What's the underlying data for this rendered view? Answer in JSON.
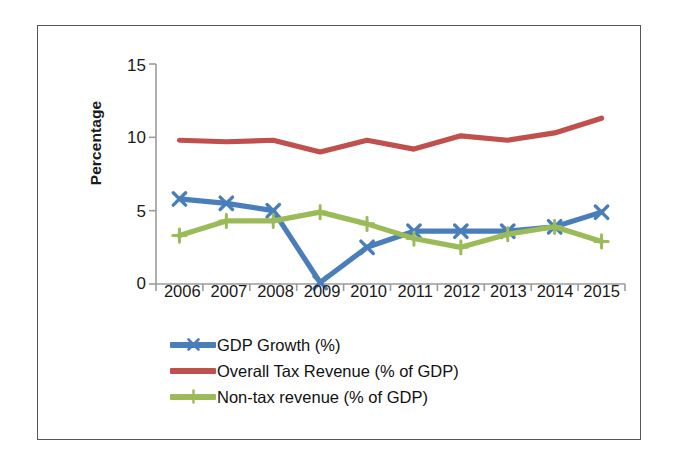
{
  "chart_data": {
    "type": "line",
    "title": "",
    "xlabel": "",
    "ylabel": "Percentage",
    "categories": [
      "2006",
      "2007",
      "2008",
      "2009",
      "2010",
      "2011",
      "2012",
      "2013",
      "2014",
      "2015"
    ],
    "ylim": [
      0,
      15
    ],
    "yticks": [
      0,
      5,
      10,
      15
    ],
    "ytick_labels": [
      "0",
      "5",
      "10",
      "15"
    ],
    "grid": false,
    "legend_position": "bottom",
    "series": [
      {
        "name": "GDP Growth (%)",
        "color": "#4A7EBB",
        "marker": "x",
        "values": [
          5.8,
          5.5,
          5.0,
          0.1,
          2.5,
          3.6,
          3.6,
          3.6,
          3.9,
          4.9
        ]
      },
      {
        "name": "Overall Tax Revenue (% of GDP)",
        "color": "#C0504D",
        "marker": "none",
        "values": [
          9.8,
          9.7,
          9.8,
          9.0,
          9.8,
          9.2,
          10.1,
          9.8,
          10.3,
          11.3
        ]
      },
      {
        "name": "Non-tax revenue (% of GDP)",
        "color": "#9BBB59",
        "marker": "plus",
        "values": [
          3.3,
          4.3,
          4.3,
          4.9,
          4.1,
          3.1,
          2.5,
          3.4,
          3.9,
          2.9
        ]
      }
    ]
  },
  "axis": {
    "ytick_labels": [
      "15",
      "10",
      "5",
      "0"
    ],
    "y_title": "Percentage",
    "xtick_labels": [
      "2006",
      "2007",
      "2008",
      "2009",
      "2010",
      "2011",
      "2012",
      "2013",
      "2014",
      "2015"
    ]
  },
  "legend": {
    "items": [
      {
        "label": "GDP Growth (%)",
        "color": "#4A7EBB",
        "marker": "x"
      },
      {
        "label": "Overall Tax Revenue (% of GDP)",
        "color": "#C0504D",
        "marker": "none"
      },
      {
        "label": "Non-tax revenue (% of GDP)",
        "color": "#9BBB59",
        "marker": "plus"
      }
    ]
  },
  "colors": {
    "series_blue": "#4A7EBB",
    "series_red": "#C0504D",
    "series_green": "#9BBB59",
    "axis_line": "#9b9b9b",
    "frame": "#56565a",
    "text": "#1a1a1a",
    "background": "#ffffff"
  }
}
